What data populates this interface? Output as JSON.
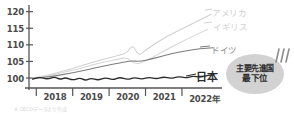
{
  "chart_data": {
    "type": "line",
    "title": "",
    "subtitle": "",
    "xlabel": "",
    "ylabel": "",
    "ylim": [
      97,
      122
    ],
    "xlim": [
      2017.3,
      2022.6
    ],
    "grid": false,
    "legend_position": "inline-right",
    "y_ticks": [
      "120",
      "115",
      "110",
      "105",
      "100"
    ],
    "y_tick_values": [
      120,
      115,
      110,
      105,
      100
    ],
    "x_ticks": [
      "2018",
      "2019",
      "2020",
      "2021",
      "2022年"
    ],
    "x_tick_values": [
      2018,
      2019,
      2020,
      2021,
      2022
    ],
    "series": [
      {
        "name": "アメリカ",
        "color": "#d0d0d0",
        "label": "アメリカ",
        "x": [
          2017.4,
          2017.8,
          2018.2,
          2018.6,
          2019.0,
          2019.4,
          2019.8,
          2020.0,
          2020.15,
          2020.3,
          2020.5,
          2020.8,
          2021.1,
          2021.5,
          2021.9,
          2022.3
        ],
        "values": [
          100.0,
          100.8,
          102.0,
          103.2,
          104.6,
          105.8,
          106.9,
          107.6,
          110.2,
          106.6,
          108.4,
          110.6,
          112.6,
          114.8,
          117.0,
          119.2
        ]
      },
      {
        "name": "イギリス",
        "color": "#d6d6d6",
        "label": "イギリス",
        "x": [
          2017.4,
          2017.8,
          2018.2,
          2018.6,
          2019.0,
          2019.4,
          2019.8,
          2020.0,
          2020.2,
          2020.4,
          2020.7,
          2021.0,
          2021.4,
          2021.8,
          2022.2
        ],
        "values": [
          100.0,
          100.6,
          101.6,
          102.6,
          103.8,
          104.9,
          105.8,
          106.2,
          104.2,
          104.6,
          106.2,
          108.2,
          110.4,
          112.6,
          114.6
        ]
      },
      {
        "name": "ドイツ",
        "color": "#7d7d7d",
        "label": "ドイツ",
        "x": [
          2017.4,
          2017.9,
          2018.3,
          2018.7,
          2019.1,
          2019.5,
          2019.9,
          2020.1,
          2020.35,
          2020.6,
          2020.9,
          2021.2,
          2021.6,
          2022.0,
          2022.35
        ],
        "values": [
          99.9,
          100.4,
          101.2,
          102.0,
          103.0,
          103.9,
          104.8,
          105.2,
          105.0,
          105.6,
          106.4,
          107.3,
          108.2,
          108.9,
          109.1
        ]
      },
      {
        "name": "日本",
        "color": "#2b2b2b",
        "label": "日本",
        "x": [
          2017.4,
          2017.6,
          2017.8,
          2018.0,
          2018.15,
          2018.3,
          2018.5,
          2018.7,
          2018.85,
          2019.0,
          2019.2,
          2019.4,
          2019.6,
          2019.8,
          2020.0,
          2020.2,
          2020.4,
          2020.6,
          2020.8,
          2021.0,
          2021.2,
          2021.4,
          2021.6,
          2021.8,
          2022.0,
          2022.2,
          2022.35
        ],
        "values": [
          99.7,
          100.3,
          99.6,
          100.4,
          99.5,
          100.2,
          99.3,
          100.1,
          99.2,
          100.0,
          99.3,
          100.2,
          99.4,
          100.3,
          99.5,
          100.2,
          99.6,
          100.3,
          99.7,
          100.4,
          99.8,
          100.5,
          100.0,
          100.6,
          100.2,
          100.8,
          101.0
        ]
      }
    ]
  },
  "annotation": {
    "callout_line1": "主要先進国",
    "callout_line2": "最下位",
    "callout_color": "#d2d2d2"
  },
  "footnote": {
    "text": "※ OECDデータより作成"
  }
}
